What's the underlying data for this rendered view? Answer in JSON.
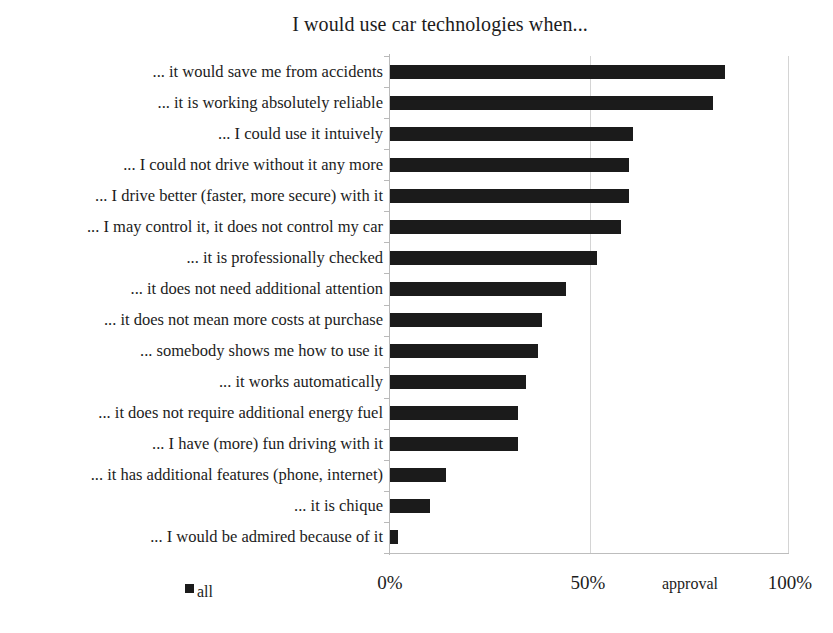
{
  "chart_data": {
    "type": "bar",
    "orientation": "horizontal",
    "title": "I would use car technologies when...",
    "xlabel": "approval",
    "ylabel": "",
    "xlim": [
      0,
      100
    ],
    "xtick_labels": [
      "0%",
      "50%",
      "100%"
    ],
    "xticks": [
      0,
      50,
      100
    ],
    "grid": true,
    "grid_axis": "x",
    "legend": {
      "position": "bottom-left",
      "entries": [
        {
          "label": "all",
          "color": "#1b1b1b"
        }
      ]
    },
    "series": [
      {
        "name": "all",
        "color": "#1b1b1b",
        "values": [
          84,
          81,
          61,
          60,
          60,
          58,
          52,
          44,
          38,
          37,
          34,
          32,
          32,
          14,
          10,
          2
        ]
      }
    ],
    "categories": [
      "... it would save me from accidents",
      "... it is working absolutely reliable",
      "... I could use it intuively",
      "... I could not drive without it any more",
      "... I drive better (faster, more secure) with it",
      "... I may control it, it does not control my car",
      "... it is professionally checked",
      "... it does not need additional attention",
      "... it does not mean more costs at purchase",
      "... somebody shows me how to use it",
      "... it works automatically",
      "... it does not require additional energy fuel",
      "... I have (more) fun driving with it",
      "... it has additional features (phone, internet)",
      "... it is chique",
      "... I would be admired because of it"
    ]
  },
  "chart": {
    "title": "I would use car technologies when...",
    "axis_title": "approval",
    "tick_0": "0%",
    "tick_50": "50%",
    "tick_100": "100%",
    "legend_label": "all"
  }
}
